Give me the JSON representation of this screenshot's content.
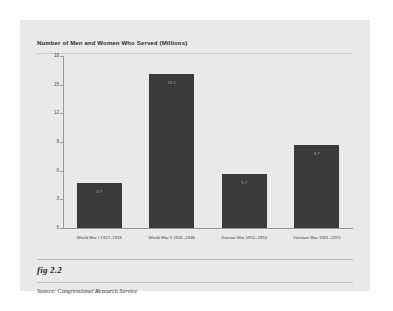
{
  "figure": {
    "caption": "fig 2.2",
    "source": "Source:  Congressional Research Service"
  },
  "chart_data": {
    "type": "bar",
    "title": "Number of Men and Women Who Served (Millions)",
    "xlabel": "",
    "ylabel": "",
    "categories": [
      "World War I 1917–1918",
      "World War II 1941–1946",
      "Korean War 1950–1953",
      "Vietnam War 1961–1975"
    ],
    "values": [
      4.7,
      16.1,
      5.7,
      8.7
    ],
    "value_labels": [
      "4.7",
      "16.1",
      "5.7",
      "8.7"
    ],
    "ylim": [
      0,
      18
    ],
    "yticks": [
      0,
      3,
      6,
      9,
      12,
      15,
      18
    ],
    "ytick_labels": [
      "0",
      "3",
      "6",
      "9",
      "12",
      "15",
      "18"
    ],
    "grid": false,
    "legend": false,
    "bar_color": "#3a3a3a",
    "background_color": "#e9e9e9",
    "axis_color": "#9a9a9a"
  }
}
